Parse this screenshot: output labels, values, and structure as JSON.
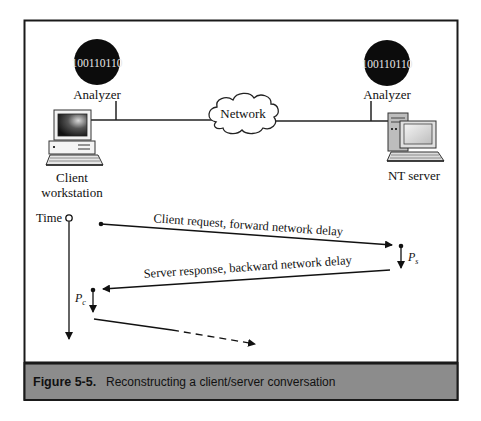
{
  "figure": {
    "number_label": "Figure 5-5.",
    "caption": "Reconstructing a client/server conversation",
    "caption_band_color": "#8c8c8c",
    "frame_color": "#1a1a1a"
  },
  "topology": {
    "left_analyzer": {
      "label": "Analyzer",
      "bits": "100110110"
    },
    "right_analyzer": {
      "label": "Analyzer",
      "bits": "100110110"
    },
    "network": {
      "label": "Network"
    },
    "client": {
      "label_line1": "Client",
      "label_line2": "workstation"
    },
    "server": {
      "label": "NT server"
    }
  },
  "timeline": {
    "axis_label": "Time",
    "request_label": "Client request, forward network delay",
    "response_label": "Server response, backward network delay",
    "server_processing": {
      "symbol": "P",
      "subscript": "s"
    },
    "client_processing": {
      "symbol": "P",
      "subscript": "c"
    }
  }
}
